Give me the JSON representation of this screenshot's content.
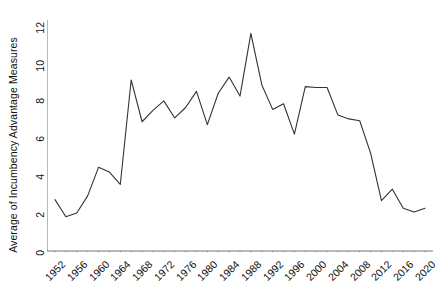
{
  "chart_data": {
    "type": "line",
    "title": "",
    "xlabel": "",
    "ylabel": "Average of Incumbency Advantage Measures",
    "xlim": [
      1950,
      2022
    ],
    "ylim": [
      0,
      12
    ],
    "grid": false,
    "legend": false,
    "line_color": "#333333",
    "axis_color": "#666666",
    "x_ticks": [
      1952,
      1956,
      1960,
      1964,
      1968,
      1972,
      1976,
      1980,
      1984,
      1988,
      1992,
      1996,
      2000,
      2004,
      2008,
      2012,
      2016,
      2020
    ],
    "y_ticks": [
      0,
      2,
      4,
      6,
      8,
      10,
      12
    ],
    "x": [
      1952,
      1954,
      1956,
      1958,
      1960,
      1962,
      1964,
      1966,
      1968,
      1970,
      1972,
      1974,
      1976,
      1978,
      1980,
      1982,
      1984,
      1986,
      1988,
      1990,
      1992,
      1994,
      1996,
      1998,
      2000,
      2002,
      2004,
      2006,
      2008,
      2010,
      2012,
      2014,
      2016,
      2018,
      2020
    ],
    "values": [
      2.65,
      1.75,
      1.95,
      2.85,
      4.35,
      4.1,
      3.45,
      8.95,
      6.75,
      7.35,
      7.85,
      6.95,
      7.5,
      8.35,
      6.6,
      8.25,
      9.1,
      8.1,
      11.4,
      8.7,
      7.4,
      7.7,
      6.1,
      8.6,
      8.55,
      8.55,
      7.1,
      6.9,
      6.8,
      5.1,
      2.6,
      3.2,
      2.2,
      2.0,
      2.2
    ],
    "x_tick_label_texts": [
      "1952",
      "1956",
      "1960",
      "1964",
      "1968",
      "1972",
      "1976",
      "1980",
      "1984",
      "1988",
      "1992",
      "1996",
      "2000",
      "2004",
      "2008",
      "2012",
      "2016",
      "2020"
    ],
    "y_tick_label_texts": [
      "0",
      "2",
      "4",
      "6",
      "8",
      "10",
      "12"
    ]
  }
}
